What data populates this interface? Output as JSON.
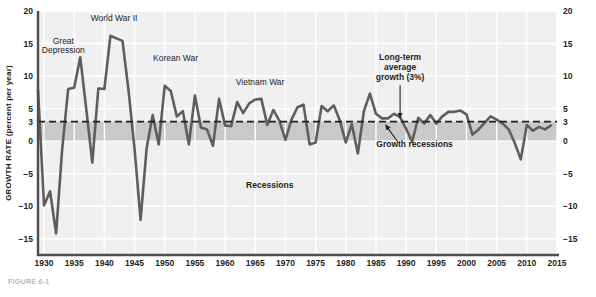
{
  "figure": {
    "caption": "FIGURE 6-1",
    "background": "#f0f0f0",
    "line_color": "#5e5e5e",
    "band_color": "#c9c9c9",
    "grid_color": "#ffffff"
  },
  "axes": {
    "ylabel": "GROWTH RATE (percent per year)",
    "xlabel": "YEAR",
    "yticks": [
      20,
      15,
      10,
      5,
      3,
      0,
      -5,
      -10,
      -15
    ],
    "ylim": [
      -17.5,
      20
    ],
    "xticks": [
      1930,
      1935,
      1940,
      1945,
      1950,
      1955,
      1960,
      1965,
      1970,
      1975,
      1980,
      1985,
      1990,
      1995,
      2000,
      2005,
      2010,
      2015
    ],
    "xlim": [
      1929,
      2015
    ]
  },
  "annotations": [
    {
      "id": "great-depression",
      "text": "Great\nDepression",
      "x": 1933.2,
      "y": 15.0,
      "bold": false,
      "align": "middle"
    },
    {
      "id": "world-war-ii",
      "text": "World War II",
      "x": 1941.6,
      "y": 18.4,
      "bold": false,
      "align": "middle"
    },
    {
      "id": "korean-war",
      "text": "Korean War",
      "x": 1951.8,
      "y": 12.3,
      "bold": false,
      "align": "middle"
    },
    {
      "id": "vietnam-war",
      "text": "Vietnam War",
      "x": 1965.8,
      "y": 8.6,
      "bold": false,
      "align": "middle"
    },
    {
      "id": "long-term-average",
      "text": "Long-term\naverage\ngrowth (3%)",
      "x": 1989.0,
      "y": 12.4,
      "bold": true,
      "align": "middle"
    },
    {
      "id": "growth-recessions",
      "text": "Growth recessions",
      "x": 1991.4,
      "y": -0.9,
      "bold": true,
      "align": "middle"
    },
    {
      "id": "recessions",
      "text": "Recessions",
      "x": 1967.4,
      "y": -7.2,
      "bold": true,
      "align": "middle"
    }
  ],
  "arrows": [
    {
      "id": "long-term-average-arrow",
      "x1": 1989.0,
      "y1": 8.6,
      "x2": 1989.0,
      "y2": 3.6
    },
    {
      "id": "growth-recessions-arrow",
      "x1": 1988.6,
      "y1": -0.1,
      "x2": 1986.6,
      "y2": 2.5
    }
  ],
  "reference_line": {
    "id": "three-percent-line",
    "value": 3,
    "style": "dashed"
  },
  "shaded_band": {
    "id": "growth-recession-band",
    "from": 0,
    "to": 3
  },
  "chart_data": {
    "type": "line",
    "title": "",
    "subtitle": "",
    "xlabel": "YEAR",
    "ylabel": "GROWTH RATE (percent per year)",
    "xlim": [
      1929,
      2015
    ],
    "ylim": [
      -17.5,
      20
    ],
    "grid": true,
    "legend": null,
    "series": [
      {
        "name": "Real GDP growth rate",
        "color": "#5e5e5e",
        "x": [
          1929,
          1930,
          1931,
          1932,
          1933,
          1934,
          1935,
          1936,
          1937,
          1938,
          1939,
          1940,
          1941,
          1942,
          1943,
          1944,
          1945,
          1946,
          1947,
          1948,
          1949,
          1950,
          1951,
          1952,
          1953,
          1954,
          1955,
          1956,
          1957,
          1958,
          1959,
          1960,
          1961,
          1962,
          1963,
          1964,
          1965,
          1966,
          1967,
          1968,
          1969,
          1970,
          1971,
          1972,
          1973,
          1974,
          1975,
          1976,
          1977,
          1978,
          1979,
          1980,
          1981,
          1982,
          1983,
          1984,
          1985,
          1986,
          1987,
          1988,
          1989,
          1990,
          1991,
          1992,
          1993,
          1994,
          1995,
          1996,
          1997,
          1998,
          1999,
          2000,
          2001,
          2002,
          2003,
          2004,
          2005,
          2006,
          2007,
          2008,
          2009,
          2010,
          2011,
          2012,
          2013,
          2014
        ],
        "y": [
          7.9,
          -9.9,
          -7.7,
          -14.2,
          -1.3,
          8.0,
          8.2,
          12.9,
          4.9,
          -3.3,
          8.1,
          8.0,
          16.2,
          15.8,
          15.4,
          7.8,
          -1.2,
          -12.1,
          -1.1,
          4.0,
          -0.5,
          8.5,
          7.7,
          3.8,
          4.6,
          -0.5,
          7.0,
          2.1,
          1.8,
          -0.7,
          6.5,
          2.4,
          2.3,
          6.0,
          4.3,
          5.8,
          6.4,
          6.5,
          2.5,
          4.8,
          3.1,
          0.2,
          3.3,
          5.2,
          5.6,
          -0.5,
          -0.2,
          5.4,
          4.6,
          5.5,
          3.2,
          -0.2,
          2.6,
          -1.9,
          4.6,
          7.3,
          4.2,
          3.5,
          3.5,
          4.2,
          3.7,
          1.9,
          -0.1,
          3.6,
          2.7,
          4.0,
          2.7,
          3.8,
          4.5,
          4.5,
          4.7,
          4.1,
          1.0,
          1.8,
          2.8,
          3.8,
          3.3,
          2.7,
          1.8,
          -0.3,
          -2.8,
          2.5,
          1.6,
          2.2,
          1.8,
          2.4
        ]
      }
    ],
    "reference_lines": [
      {
        "label": "Long-term average growth (3%)",
        "value": 3,
        "axis": "y",
        "style": "dashed"
      }
    ],
    "shaded_regions": [
      {
        "label": "Growth recessions",
        "ymin": 0,
        "ymax": 3
      }
    ],
    "event_annotations": [
      "Great Depression",
      "World War II",
      "Korean War",
      "Vietnam War",
      "Recessions",
      "Growth recessions",
      "Long-term average growth (3%)"
    ]
  }
}
